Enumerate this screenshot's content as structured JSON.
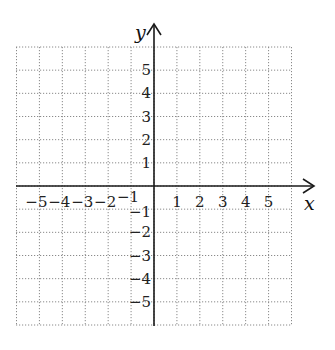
{
  "diagram": {
    "type": "cartesian-coordinate-grid",
    "x_axis": {
      "label": "x",
      "min": -6,
      "max": 6,
      "tick_labels": [
        "−5",
        "−4",
        "−3",
        "−2",
        "−1",
        "1",
        "2",
        "3",
        "4",
        "5"
      ],
      "tick_values": [
        -5,
        -4,
        -3,
        -2,
        -1,
        1,
        2,
        3,
        4,
        5
      ],
      "arrow": "positive"
    },
    "y_axis": {
      "label": "y",
      "min": -6,
      "max": 6,
      "tick_labels": [
        "5",
        "4",
        "3",
        "2",
        "1",
        "−1",
        "−2",
        "−3",
        "−4",
        "−5"
      ],
      "tick_values": [
        5,
        4,
        3,
        2,
        1,
        -1,
        -2,
        -3,
        -4,
        -5
      ],
      "arrow": "positive"
    },
    "grid": {
      "style": "dotted",
      "spacing": 1,
      "color": "#8a8a8a"
    },
    "axis_color": "#1a1a1a"
  }
}
